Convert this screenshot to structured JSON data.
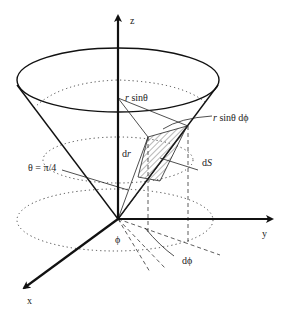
{
  "figure": {
    "type": "spherical coordinates cone surface element",
    "labels": {
      "z_axis": "z",
      "y_axis": "y",
      "x_axis": "x",
      "r_sin_theta": "r sinθ",
      "r_sin_theta_r": "r",
      "r_sin_theta_rest": " sinθ",
      "r_sin_theta_dphi_r": "r",
      "r_sin_theta_dphi_rest": " sinθ dϕ",
      "dr_d": "d",
      "dr_r": "r",
      "dS_d": "d",
      "dS_S": "S",
      "theta_eq": "θ = π/4",
      "phi": "ϕ",
      "dphi": "dϕ"
    },
    "cone_half_angle": "π/4",
    "colors": {
      "ink": "#111111",
      "background": "#ffffff"
    }
  }
}
